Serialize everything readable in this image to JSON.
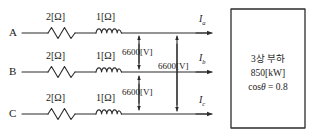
{
  "diagram": {
    "type": "three-phase-circuit-schematic",
    "phases": [
      {
        "name": "A",
        "resistance": "2[Ω]",
        "reactance": "1[Ω]",
        "current": "I",
        "current_sub": "a"
      },
      {
        "name": "B",
        "resistance": "2[Ω]",
        "reactance": "1[Ω]",
        "current": "I",
        "current_sub": "b"
      },
      {
        "name": "C",
        "resistance": "2[Ω]",
        "reactance": "1[Ω]",
        "current": "I",
        "current_sub": "c"
      }
    ],
    "voltages": [
      {
        "label": "6600[V]",
        "between": "A-B"
      },
      {
        "label": "6600[V]",
        "between": "B-C"
      },
      {
        "label": "6600[V]",
        "between": "A-C"
      }
    ],
    "load": {
      "line1": "3상 부하",
      "line2": "850[kW]",
      "line3_prefix": "cos",
      "line3_theta": "θ",
      "line3_suffix": " = 0.8"
    },
    "colors": {
      "stroke": "#2b2b2b",
      "text": "#1a1a1a",
      "background": "#ffffff"
    }
  }
}
